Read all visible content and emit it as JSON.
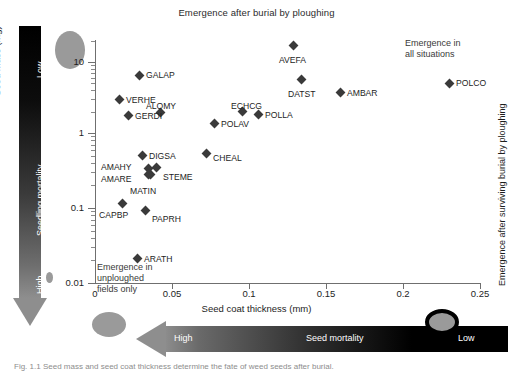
{
  "figure": {
    "title": "Emergence after burial by ploughing",
    "caption": "Fig. 1.1 Seed mass and seed coat thickness determine the fate of weed seeds after burial."
  },
  "axes": {
    "x": {
      "label": "Seed coat thickness (mm)",
      "ticks": [
        "0",
        "0.05",
        "0.1",
        "0.15",
        "0.2",
        "0.25"
      ],
      "min": 0,
      "max": 0.25
    },
    "y": {
      "label": "Seed mass (mg)",
      "ticks": [
        "10",
        "1",
        "0.1",
        "0.01"
      ],
      "scale": "log",
      "min": 0.01,
      "max": 20
    },
    "right": {
      "label": "Emergence after surviving burial by ploughing"
    }
  },
  "annotations": {
    "all_situations": "Emergence in\nall situations",
    "unploughed_only": "Emergence in\nunploughed\nfields only"
  },
  "arrows": {
    "vertical": {
      "title": "Seedling mortality",
      "top": "Low",
      "bottom": "High"
    },
    "horizontal": {
      "title": "Seed mortality",
      "left": "High",
      "right": "Low"
    }
  },
  "chart_data": {
    "type": "scatter",
    "title": "Emergence after burial by ploughing",
    "xlabel": "Seed coat thickness (mm)",
    "ylabel": "Seed mass (mg)",
    "xlim": [
      0,
      0.25
    ],
    "ylim": [
      0.01,
      20
    ],
    "yscale": "log",
    "grid": false,
    "legend": "none",
    "points": [
      {
        "name": "AVEFA",
        "x": 0.128,
        "y": 16.0,
        "px": 293,
        "py": 45,
        "lx": 279,
        "ly": 55
      },
      {
        "name": "GALAP",
        "x": 0.0285,
        "y": 7.3,
        "px": 139,
        "py": 75,
        "lx": 146,
        "ly": 70
      },
      {
        "name": "DATST",
        "x": 0.133,
        "y": 6.6,
        "px": 301,
        "py": 79,
        "lx": 288,
        "ly": 89
      },
      {
        "name": "POLCO",
        "x": 0.2295,
        "y": 5.9,
        "px": 449,
        "py": 83,
        "lx": 456,
        "ly": 78
      },
      {
        "name": "AMBAR",
        "x": 0.158,
        "y": 4.2,
        "px": 340,
        "py": 92,
        "lx": 347,
        "ly": 88
      },
      {
        "name": "VERHE",
        "x": 0.0155,
        "y": 3.3,
        "px": 119,
        "py": 99,
        "lx": 126,
        "ly": 95
      },
      {
        "name": "ALOMY",
        "x": 0.0425,
        "y": 2.25,
        "px": 160,
        "py": 112,
        "lx": 146,
        "ly": 101
      },
      {
        "name": "ECHCG",
        "x": 0.0955,
        "y": 2.2,
        "px": 242,
        "py": 111,
        "lx": 231,
        "ly": 101
      },
      {
        "name": "GERDI",
        "x": 0.0215,
        "y": 1.95,
        "px": 128,
        "py": 115,
        "lx": 135,
        "ly": 111
      },
      {
        "name": "POLLA",
        "x": 0.1055,
        "y": 1.9,
        "px": 258,
        "py": 114,
        "lx": 265,
        "ly": 110
      },
      {
        "name": "POLAV",
        "x": 0.0775,
        "y": 1.45,
        "px": 214,
        "py": 123,
        "lx": 221,
        "ly": 119
      },
      {
        "name": "CHEAL",
        "x": 0.0725,
        "y": 0.63,
        "px": 206,
        "py": 153,
        "lx": 213,
        "ly": 153
      },
      {
        "name": "DIGSA",
        "x": 0.0305,
        "y": 0.66,
        "px": 142,
        "py": 155,
        "lx": 149,
        "ly": 151
      },
      {
        "name": "AMAHY",
        "x": 0.0345,
        "y": 0.45,
        "px": 148,
        "py": 168,
        "lx": 101,
        "ly": 162
      },
      {
        "name": "STEME",
        "x": 0.0385,
        "y": 0.46,
        "px": 156,
        "py": 167,
        "lx": 163,
        "ly": 172
      },
      {
        "name": "AMARE",
        "x": 0.0355,
        "y": 0.39,
        "px": 150,
        "py": 174,
        "lx": 101,
        "ly": 174
      },
      {
        "name": "MATIN",
        "x": 0.0345,
        "y": 0.3,
        "px": 148,
        "py": 174,
        "lx": 130,
        "ly": 186
      },
      {
        "name": "CAPBP",
        "x": 0.0175,
        "y": 0.125,
        "px": 122,
        "py": 203,
        "lx": 99,
        "ly": 210
      },
      {
        "name": "PAPRH",
        "x": 0.0325,
        "y": 0.105,
        "px": 145,
        "py": 210,
        "lx": 152,
        "ly": 214
      },
      {
        "name": "ARATH",
        "x": 0.0275,
        "y": 0.022,
        "px": 137,
        "py": 258,
        "lx": 144,
        "ly": 254
      }
    ]
  }
}
